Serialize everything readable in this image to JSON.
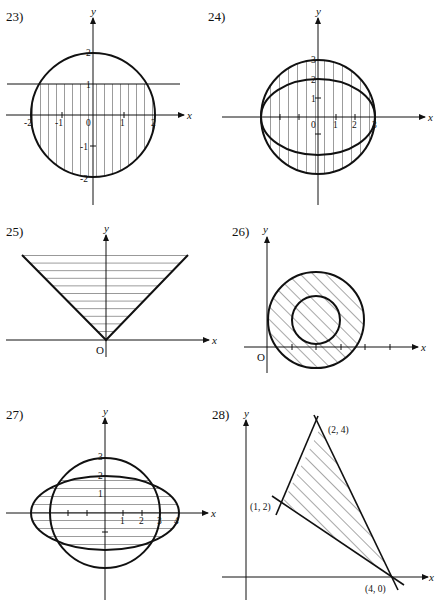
{
  "figures": [
    {
      "id": "23",
      "label": "23)",
      "axes": {
        "x": "x",
        "y": "y"
      },
      "x_ticks": [
        "-2",
        "-1",
        "0",
        "1",
        "2"
      ],
      "y_ticks": [
        "2",
        "1",
        "-1",
        "-2"
      ],
      "description": "Circle x^2+y^2=4 with horizontal line y=1; region inside circle below y=1 shaded with vertical lines"
    },
    {
      "id": "24",
      "label": "24)",
      "axes": {
        "x": "x",
        "y": "y"
      },
      "x_ticks": [
        "0",
        "1",
        "2",
        "3"
      ],
      "y_ticks": [
        "3",
        "2",
        "1"
      ],
      "description": "Circle radius 3 and ellipse x-radius 3, y-radius 2; region between them shaded with vertical lines"
    },
    {
      "id": "25",
      "label": "25)",
      "axes": {
        "x": "x",
        "y": "y"
      },
      "origin_label": "O",
      "description": "V-shaped graph y=|x|; region above shaded with horizontal lines"
    },
    {
      "id": "26",
      "label": "26)",
      "axes": {
        "x": "x",
        "y": "y"
      },
      "origin_label": "O",
      "description": "Annulus between two concentric circles; shaded with diagonal lines"
    },
    {
      "id": "27",
      "label": "27)",
      "axes": {
        "x": "x",
        "y": "y"
      },
      "x_ticks": [
        "1",
        "2",
        "3",
        "4"
      ],
      "y_ticks": [
        "3",
        "2",
        "1"
      ],
      "description": "Circle radius 3 and ellipse x-radius 4, y-radius 2; region inside ellipse outside circle shaded with horizontal lines"
    },
    {
      "id": "28",
      "label": "28)",
      "axes": {
        "x": "x",
        "y": "y"
      },
      "points": [
        "(2, 4)",
        "(1, 2)",
        "(4, 0)"
      ],
      "description": "Triangle with vertices (1,2), (2,4), (4,0); interior shaded with diagonal lines"
    }
  ]
}
